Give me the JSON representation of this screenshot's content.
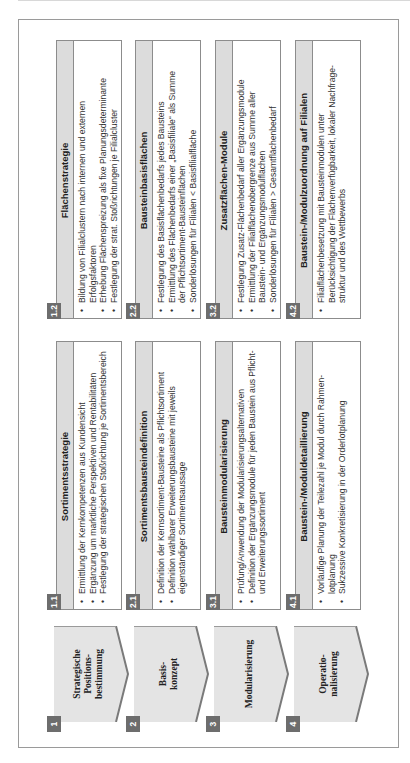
{
  "colors": {
    "frame_border": "#9a9a9a",
    "header_strip": "#dcdcdc",
    "badge": "#6d6d6d",
    "chevron_fill": "#e4e4e4",
    "chevron_shadow": "#7a7a7a"
  },
  "phases": [
    {
      "number": "1",
      "label": "Strategische\nPositions-\nbestimmung",
      "boxes": [
        {
          "number": "1.1",
          "title": "Sortimentsstrategie",
          "bullets": [
            "Ermittlung der Kernkompetenzen aus Kundensicht",
            "Ergänzung um marktliche Perspektiven und Rentabilitäten",
            "Festlegung der strategischen Stoßrichtung je Sortimentsbereich"
          ]
        },
        {
          "number": "1.2",
          "title": "Flächenstrategie",
          "bullets": [
            "Bildung von Filialclustern nach internen und externen\nErfolgsfaktoren",
            "Erhebung Flächenspreizung als fixe Planungsdeterminante",
            "Festlegung der strat. Stoßrichtungen je Filialcluster"
          ]
        }
      ]
    },
    {
      "number": "2",
      "label": "Basis-\nkonzept",
      "boxes": [
        {
          "number": "2.1",
          "title": "Sortimentsbausteindefinition",
          "bullets": [
            "Definition der Kernsortiment-Bausteine als Pflichtsortiment",
            "Definition wählbarer Erweiterungsbausteine mit jeweils\neigenständiger Sortimentsaussage"
          ]
        },
        {
          "number": "2.2",
          "title": "Bausteinbasisflächen",
          "bullets": [
            "Festlegung des Basisflächenbedarfs jedes Bausteins",
            "Ermittlung des Flächenbedarfs einer „Basisfiliale“ als Summe\nder Pflichtsortiment-Bausteinflächen",
            "Sonderlösungen für Filialen < Basisfilialfläche"
          ]
        }
      ]
    },
    {
      "number": "3",
      "label": "Modularisierung",
      "boxes": [
        {
          "number": "3.1",
          "title": "Bausteinmodularisierung",
          "bullets": [
            "Prüfung/Anwendung der Modularisierungsalternativen",
            "Definition der Ergänzungsmodule für jeden Baustein aus Pflicht-\nund Erweiterungssortiment"
          ]
        },
        {
          "number": "3.2",
          "title": "Zusatzflächen-Module",
          "bullets": [
            "Festlegung Zusatz-Flächenbedarf aller Ergänzungsmodule",
            "Ermittlung der Filialflächenobergrenze aus Summe aller\nBaustein- und Ergänzungsmodulflächen",
            "Sonderlösungen für Filialen > Gesamtflächenbedarf"
          ]
        }
      ]
    },
    {
      "number": "4",
      "label": "Operatio-\nnalisierung",
      "boxes": [
        {
          "number": "4.1",
          "title": "Baustein-/Moduldetaillierung",
          "bullets": [
            "Vorläufige Planung der Teilezahl je Modul durch Rahmen-\nlotplanung",
            "Sukzessive Konkretisierung in der Orderlotplanung"
          ]
        },
        {
          "number": "4.2",
          "title": "Baustein-/Modulzuordnung auf Filialen",
          "bullets": [
            "Filialflächenbesetzung mit Bausteinmodulen unter\nBerücksichtigung der Flächenverfügbarkeit, lokaler Nachfrage-\nstruktur und des Wettbewerbs"
          ]
        }
      ]
    }
  ]
}
